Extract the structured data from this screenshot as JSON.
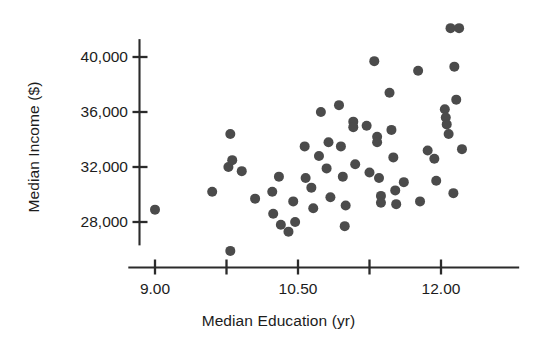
{
  "figure": {
    "width": 557,
    "height": 349,
    "background": "#ffffff",
    "point_color": "#4b4b4b",
    "axis_color": "#2b2b2b",
    "text_color": "#1c1c1c"
  },
  "labels": {
    "y_axis_title": "Median Income ($)",
    "x_axis_title": "Median Education (yr)"
  },
  "axes": {
    "y_tick_labels": [
      "40,000",
      "36,000",
      "32,000",
      "28,000"
    ],
    "x_tick_labels": [
      "9.00",
      "10.50",
      "12.00"
    ]
  },
  "chart_data": {
    "type": "scatter",
    "title": "",
    "xlabel": "Median Education (yr)",
    "ylabel": "Median Income ($)",
    "xlim": [
      8.7,
      12.8
    ],
    "ylim": [
      25200,
      42600
    ],
    "xticks": [
      9.0,
      9.75,
      10.5,
      11.25,
      12.0
    ],
    "xticklabels": [
      "9.00",
      "",
      "10.50",
      "",
      "12.00"
    ],
    "yticks": [
      28000,
      32000,
      36000,
      40000
    ],
    "yticklabels": [
      "28,000",
      "32,000",
      "36,000",
      "40,000"
    ],
    "grid": false,
    "legend": null,
    "marker": "circle",
    "marker_color": "#4b4b4b",
    "marker_size": 7,
    "n_points": 61,
    "points": [
      [
        9.0,
        28900
      ],
      [
        9.6,
        30200
      ],
      [
        9.79,
        34400
      ],
      [
        9.79,
        25900
      ],
      [
        9.77,
        32000
      ],
      [
        9.81,
        32500
      ],
      [
        9.91,
        31700
      ],
      [
        10.05,
        29700
      ],
      [
        10.23,
        30200
      ],
      [
        10.24,
        28600
      ],
      [
        10.3,
        31300
      ],
      [
        10.32,
        27800
      ],
      [
        10.4,
        27300
      ],
      [
        10.45,
        29500
      ],
      [
        10.47,
        28000
      ],
      [
        10.57,
        33500
      ],
      [
        10.58,
        31200
      ],
      [
        10.64,
        30500
      ],
      [
        10.66,
        29000
      ],
      [
        10.72,
        32800
      ],
      [
        10.74,
        36000
      ],
      [
        10.8,
        31900
      ],
      [
        10.82,
        33800
      ],
      [
        10.84,
        29800
      ],
      [
        10.93,
        36500
      ],
      [
        10.95,
        33500
      ],
      [
        10.97,
        31300
      ],
      [
        11.0,
        29200
      ],
      [
        11.08,
        35300
      ],
      [
        11.08,
        34900
      ],
      [
        11.1,
        32200
      ],
      [
        11.3,
        39700
      ],
      [
        11.33,
        34200
      ],
      [
        11.33,
        33800
      ],
      [
        11.35,
        31200
      ],
      [
        11.37,
        29900
      ],
      [
        11.37,
        29400
      ],
      [
        11.46,
        37400
      ],
      [
        11.48,
        34700
      ],
      [
        11.5,
        32700
      ],
      [
        11.52,
        30300
      ],
      [
        11.53,
        29300
      ],
      [
        11.76,
        39000
      ],
      [
        11.78,
        29500
      ],
      [
        11.86,
        33200
      ],
      [
        11.93,
        32600
      ],
      [
        11.95,
        31000
      ],
      [
        12.04,
        36200
      ],
      [
        12.05,
        35600
      ],
      [
        12.06,
        35100
      ],
      [
        12.08,
        34400
      ],
      [
        12.1,
        42100
      ],
      [
        12.19,
        42100
      ],
      [
        12.14,
        39300
      ],
      [
        12.16,
        36900
      ],
      [
        12.22,
        33300
      ],
      [
        12.13,
        30100
      ],
      [
        11.25,
        31600
      ],
      [
        11.22,
        35000
      ],
      [
        11.61,
        30900
      ],
      [
        10.99,
        27700
      ]
    ]
  }
}
